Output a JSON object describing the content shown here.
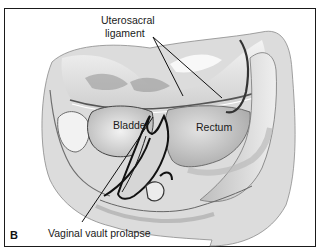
{
  "figure": {
    "panel_letter": "B",
    "labels": {
      "uterosacral_line1": "Uterosacral",
      "uterosacral_line2": "ligament",
      "bladder": "Bladder",
      "rectum": "Rectum",
      "vaginal_vault": "Vaginal vault prolapse"
    },
    "colors": {
      "frame": "#1a1a1a",
      "background": "#ffffff",
      "tissue_light": "#e8e8e8",
      "tissue_mid": "#b5b5b5",
      "tissue_dark": "#4a4a4a",
      "leader_line": "#111111"
    }
  }
}
